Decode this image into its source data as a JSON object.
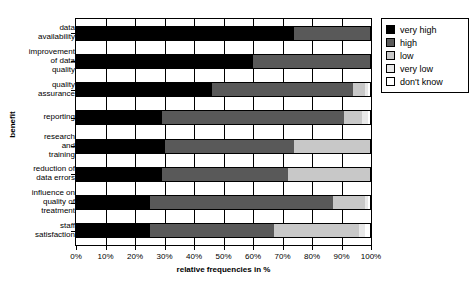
{
  "chart_data": {
    "type": "bar",
    "subtype": "stacked-horizontal-100",
    "title": "",
    "xlabel": "relative frequencies in %",
    "ylabel": "benefit",
    "xlim": [
      0,
      100
    ],
    "grid": true,
    "legend_position": "right",
    "xticks": [
      "0%",
      "10%",
      "20%",
      "30%",
      "40%",
      "50%",
      "60%",
      "70%",
      "80%",
      "90%",
      "100%"
    ],
    "xtick_values": [
      0,
      10,
      20,
      30,
      40,
      50,
      60,
      70,
      80,
      90,
      100
    ],
    "categories": [
      "data availability",
      "improvement of data quality",
      "quality assurance",
      "reporting",
      "research and training",
      "reduction of data errors",
      "influence on quality of treatment",
      "staff satisfaction"
    ],
    "series": [
      {
        "name": "very high",
        "color": "#000000",
        "values": [
          74,
          60,
          46,
          29,
          30,
          29,
          25,
          25
        ]
      },
      {
        "name": "high",
        "color": "#595959",
        "values": [
          26,
          40,
          48,
          62,
          44,
          43,
          62,
          42
        ]
      },
      {
        "name": "low",
        "color": "#c8c8c8",
        "values": [
          0,
          0,
          4,
          6,
          26,
          28,
          11,
          29
        ]
      },
      {
        "name": "very low",
        "color": "#e8e8e8",
        "values": [
          0,
          0,
          1,
          2,
          0,
          0,
          1,
          2
        ]
      },
      {
        "name": "don't know",
        "color": "#ffffff",
        "values": [
          0,
          0,
          1,
          1,
          0,
          0,
          1,
          2
        ]
      }
    ]
  },
  "legend": {
    "items": [
      {
        "label": "very high",
        "color": "#000000"
      },
      {
        "label": "high",
        "color": "#595959"
      },
      {
        "label": "low",
        "color": "#c8c8c8"
      },
      {
        "label": "very low",
        "color": "#e8e8e8"
      },
      {
        "label": "don't know",
        "color": "#ffffff"
      }
    ]
  }
}
